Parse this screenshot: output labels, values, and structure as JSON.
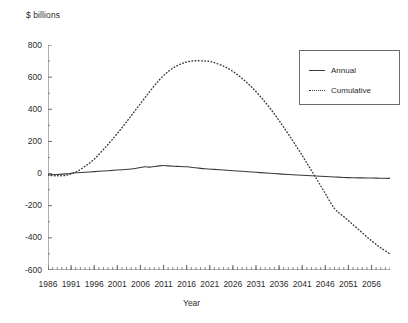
{
  "chart_data": {
    "type": "line",
    "title": "",
    "ylabel": "$ billions",
    "xlabel": "Year",
    "ylim": [
      -600,
      800
    ],
    "xlim": [
      1986,
      2060
    ],
    "yticks": [
      800,
      600,
      400,
      200,
      0,
      -200,
      -400,
      -600
    ],
    "ytick_labels": [
      "800",
      "600",
      "400",
      "200",
      "0",
      "-200",
      "-400",
      "-600"
    ],
    "xticks": [
      1986,
      1991,
      1996,
      2001,
      2006,
      2011,
      2016,
      2021,
      2026,
      2031,
      2036,
      2041,
      2046,
      2051,
      2056
    ],
    "xtick_labels": [
      "1986",
      "1991",
      "1996",
      "2001",
      "2006",
      "2011",
      "2016",
      "2021",
      "2026",
      "2031",
      "2036",
      "2041",
      "2046",
      "2051",
      "2056"
    ],
    "minor_tick_interval": 1,
    "grid": false,
    "legend_position": "upper right",
    "series": [
      {
        "name": "Annual",
        "style": "solid",
        "color": "#3a3a3a",
        "x": [
          1986,
          1988,
          1990,
          1991,
          1992,
          1994,
          1996,
          1998,
          2000,
          2002,
          2004,
          2006,
          2007,
          2008,
          2009,
          2010,
          2011,
          2012,
          2014,
          2016,
          2018,
          2020,
          2022,
          2024,
          2026,
          2028,
          2030,
          2032,
          2034,
          2036,
          2038,
          2040,
          2042,
          2044,
          2046,
          2048,
          2050,
          2052,
          2054,
          2056,
          2058,
          2060
        ],
        "values": [
          -8,
          -6,
          -2,
          2,
          5,
          8,
          12,
          16,
          20,
          24,
          28,
          38,
          42,
          40,
          44,
          48,
          50,
          48,
          45,
          42,
          36,
          30,
          26,
          22,
          18,
          14,
          10,
          6,
          2,
          -2,
          -6,
          -9,
          -12,
          -15,
          -18,
          -21,
          -24,
          -26,
          -27,
          -28,
          -29,
          -30
        ]
      },
      {
        "name": "Cumulative",
        "style": "dotted",
        "color": "#3a3a3a",
        "x": [
          1986,
          1988,
          1990,
          1992,
          1994,
          1996,
          1998,
          2000,
          2002,
          2004,
          2006,
          2008,
          2010,
          2012,
          2014,
          2016,
          2018,
          2020,
          2021,
          2022,
          2024,
          2026,
          2028,
          2030,
          2032,
          2034,
          2036,
          2038,
          2040,
          2042,
          2044,
          2046,
          2048,
          2050,
          2052,
          2054,
          2056,
          2058,
          2060
        ],
        "values": [
          -10,
          -14,
          -10,
          10,
          45,
          90,
          150,
          215,
          285,
          360,
          435,
          510,
          580,
          635,
          672,
          694,
          702,
          700,
          698,
          690,
          668,
          636,
          592,
          540,
          478,
          408,
          330,
          246,
          158,
          66,
          -28,
          -124,
          -218,
          -268,
          -318,
          -368,
          -418,
          -462,
          -500
        ]
      }
    ],
    "annotations": []
  },
  "legend": {
    "entries": [
      {
        "label": "Annual"
      },
      {
        "label": "Cumulative"
      }
    ]
  }
}
